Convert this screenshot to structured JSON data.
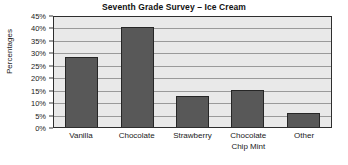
{
  "chart_data": {
    "type": "bar",
    "title": "Seventh Grade Survey – Ice Cream",
    "xlabel": "",
    "ylabel": "Percentages",
    "categories": [
      "Vanilla",
      "Chocolate",
      "Strawberry",
      "Chocolate Chip Mint",
      "Other"
    ],
    "category_lines": [
      [
        "Vanilla"
      ],
      [
        "Chocolate"
      ],
      [
        "Strawberry"
      ],
      [
        "Chocolate",
        "Chip Mint"
      ],
      [
        "Other"
      ]
    ],
    "values": [
      28,
      40,
      12.5,
      15,
      5.5
    ],
    "ylim": [
      0,
      45
    ],
    "ytick_values": [
      0,
      5,
      10,
      15,
      20,
      25,
      30,
      35,
      40,
      45
    ],
    "ytick_labels": [
      "0%",
      "5%",
      "10%",
      "15%",
      "20%",
      "25%",
      "30%",
      "35%",
      "40%",
      "45%"
    ],
    "grid": true,
    "legend": false,
    "colors": {
      "bar_fill": "#585858",
      "bar_border": "#262626",
      "plot_background": "#e9e9e9",
      "gridline": "#9a9a9a",
      "axis": "#2e2e2e",
      "text": "#1a1a1a"
    }
  }
}
